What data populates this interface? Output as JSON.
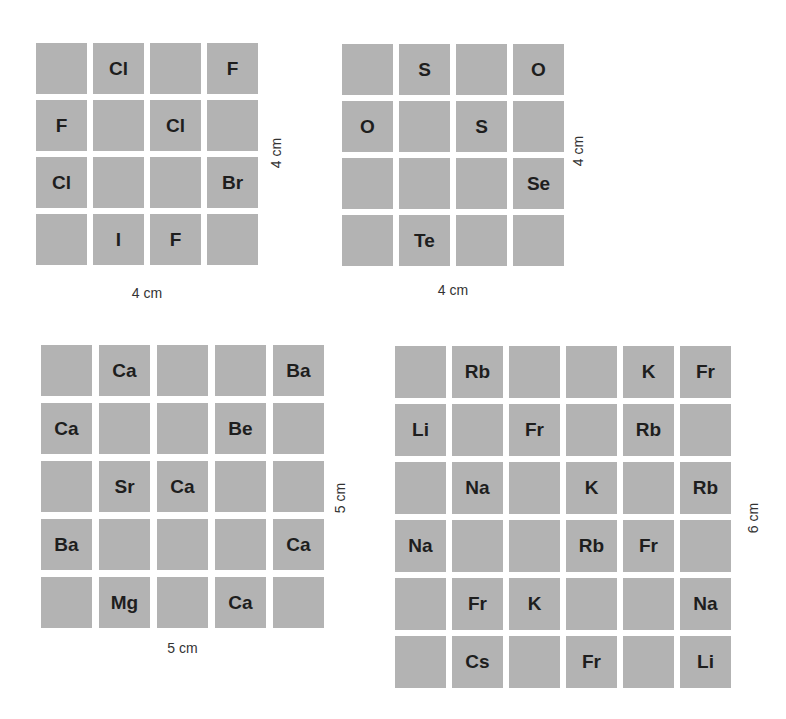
{
  "grids": [
    {
      "id": "grid-a",
      "size": 4,
      "bottom_label": "4 cm",
      "side_label": "4 cm",
      "cells": [
        [
          "",
          "Cl",
          "",
          "F"
        ],
        [
          "F",
          "",
          "Cl",
          ""
        ],
        [
          "Cl",
          "",
          "",
          "Br"
        ],
        [
          "",
          "I",
          "F",
          ""
        ]
      ]
    },
    {
      "id": "grid-b",
      "size": 4,
      "bottom_label": "4 cm",
      "side_label": "4 cm",
      "cells": [
        [
          "",
          "S",
          "",
          "O"
        ],
        [
          "O",
          "",
          "S",
          ""
        ],
        [
          "",
          "",
          "",
          "Se"
        ],
        [
          "",
          "Te",
          "",
          ""
        ]
      ]
    },
    {
      "id": "grid-c",
      "size": 5,
      "bottom_label": "5 cm",
      "side_label": "5 cm",
      "cells": [
        [
          "",
          "Ca",
          "",
          "",
          "Ba"
        ],
        [
          "Ca",
          "",
          "",
          "Be",
          ""
        ],
        [
          "",
          "Sr",
          "Ca",
          "",
          ""
        ],
        [
          "Ba",
          "",
          "",
          "",
          "Ca"
        ],
        [
          "",
          "Mg",
          "",
          "Ca",
          ""
        ]
      ]
    },
    {
      "id": "grid-d",
      "size": 6,
      "bottom_label": "",
      "side_label": "6 cm",
      "cells": [
        [
          "",
          "Rb",
          "",
          "",
          "K",
          "Fr"
        ],
        [
          "Li",
          "",
          "Fr",
          "",
          "Rb",
          ""
        ],
        [
          "",
          "Na",
          "",
          "K",
          "",
          "Rb"
        ],
        [
          "Na",
          "",
          "",
          "Rb",
          "Fr",
          ""
        ],
        [
          "",
          "Fr",
          "K",
          "",
          "",
          "Na"
        ],
        [
          "",
          "Cs",
          "",
          "Fr",
          "",
          "Li"
        ]
      ]
    }
  ],
  "colors": {
    "cell": "#b3b3b3",
    "text": "#1e1e1e",
    "background": "#ffffff"
  }
}
